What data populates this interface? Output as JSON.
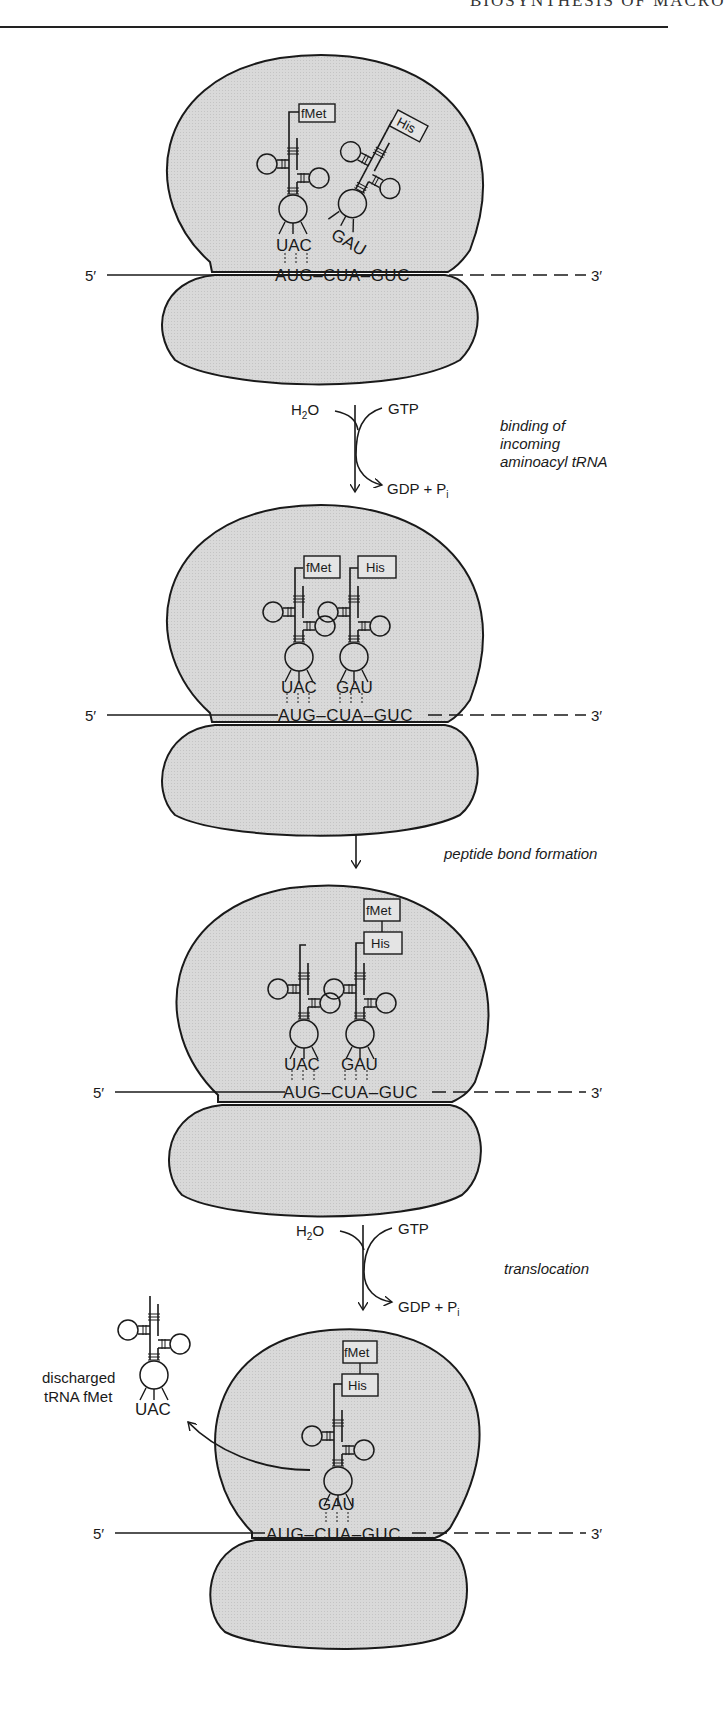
{
  "header": {
    "running_head": "BIOSYNTHESIS OF MACRO"
  },
  "colors": {
    "ribosome_fill": "#d6d6d6",
    "stroke": "#1a1a1a",
    "background": "#ffffff"
  },
  "mrna": {
    "five_prime": "5′",
    "three_prime": "3′",
    "codons": "AUG–CUA–GUC"
  },
  "panels": [
    {
      "name": "initial",
      "trnas": [
        {
          "amino_acid": "fMet",
          "anticodon": "UAC"
        },
        {
          "amino_acid": "His",
          "anticodon": "GAU"
        }
      ]
    },
    {
      "name": "after-binding",
      "trnas": [
        {
          "amino_acid": "fMet",
          "anticodon": "UAC"
        },
        {
          "amino_acid": "His",
          "anticodon": "GAU"
        }
      ]
    },
    {
      "name": "after-peptide-bond",
      "peptide": [
        "fMet",
        "His"
      ],
      "trnas": [
        {
          "anticodon": "UAC"
        },
        {
          "anticodon": "GAU"
        }
      ]
    },
    {
      "name": "after-translocation",
      "peptide": [
        "fMet",
        "His"
      ],
      "trnas": [
        {
          "anticodon": "GAU"
        }
      ],
      "released": {
        "label_line1": "discharged",
        "label_line2": "tRNA fMet",
        "anticodon": "UAC"
      }
    }
  ],
  "steps": [
    {
      "label_lines": [
        "binding of",
        "incoming",
        "aminoacyl tRNA"
      ],
      "inputs": [
        "H₂O",
        "GTP"
      ],
      "output": "GDP + Pᵢ"
    },
    {
      "label_lines": [
        "peptide bond formation"
      ]
    },
    {
      "label_lines": [
        "translocation"
      ],
      "inputs": [
        "H₂O",
        "GTP"
      ],
      "output": "GDP + Pᵢ"
    }
  ]
}
